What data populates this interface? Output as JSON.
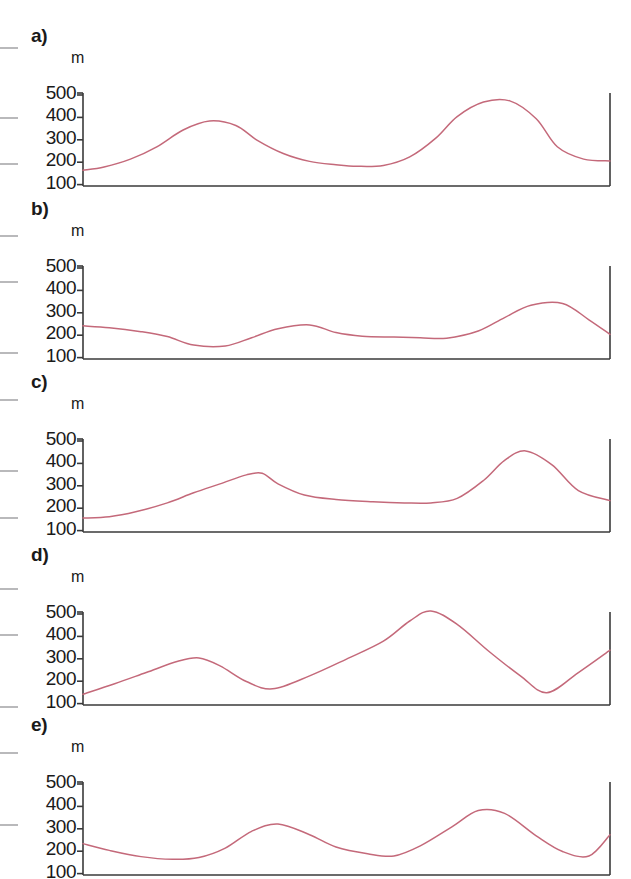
{
  "figure": {
    "curve_color": "#c4697a",
    "axis_color": "#3a3a3a",
    "text_color": "#1a1a1a",
    "edge_tick_color": "#b9b9bb",
    "unit_label": "m",
    "ytick_labels": [
      "500",
      "400",
      "300",
      "200",
      "100"
    ],
    "panel_labels": [
      "a)",
      "b)",
      "c)",
      "d)",
      "e)"
    ]
  },
  "chart_data": [
    {
      "type": "line",
      "title": "a)",
      "xlabel": "",
      "ylabel": "m",
      "ylim": [
        0,
        560
      ],
      "yticks": [
        100,
        200,
        300,
        400,
        500
      ],
      "grid": false,
      "legend": "none",
      "series": [
        {
          "name": "elevation",
          "x": [
            0,
            4,
            9,
            14,
            19,
            24,
            29,
            33,
            38,
            43,
            48,
            52,
            57,
            62,
            67,
            71,
            76,
            81,
            86,
            90,
            95,
            100
          ],
          "values": [
            70,
            85,
            120,
            175,
            250,
            290,
            270,
            205,
            145,
            110,
            95,
            88,
            92,
            130,
            215,
            310,
            375,
            380,
            300,
            175,
            120,
            112
          ]
        }
      ],
      "note": "three ridges; peaks approx 290 m, 380 m, 285 m with valleys near 90 m and 112 m; ends at 140 m"
    },
    {
      "type": "line",
      "title": "b)",
      "xlabel": "",
      "ylabel": "m",
      "ylim": [
        0,
        560
      ],
      "yticks": [
        100,
        200,
        300,
        400,
        500
      ],
      "grid": false,
      "legend": "none",
      "series": [
        {
          "name": "elevation",
          "x": [
            0,
            5,
            11,
            16,
            21,
            27,
            32,
            37,
            43,
            48,
            53,
            59,
            64,
            69,
            75,
            80,
            85,
            91,
            96,
            100
          ],
          "values": [
            148,
            140,
            122,
            100,
            62,
            58,
            95,
            135,
            152,
            118,
            102,
            98,
            95,
            93,
            125,
            185,
            240,
            248,
            175,
            110
          ]
        }
      ],
      "note": "low relief profile; minimum about 55 m, highest peak about 248 m, rises to 220 m at right edge"
    },
    {
      "type": "line",
      "title": "c)",
      "xlabel": "",
      "ylabel": "m",
      "ylim": [
        0,
        560
      ],
      "yticks": [
        100,
        200,
        300,
        400,
        500
      ],
      "grid": false,
      "legend": "none",
      "series": [
        {
          "name": "elevation",
          "x": [
            0,
            5,
            10,
            16,
            21,
            26,
            31,
            34,
            37,
            42,
            48,
            55,
            61,
            66,
            71,
            76,
            80,
            84,
            89,
            94,
            100
          ],
          "values": [
            62,
            68,
            90,
            130,
            175,
            215,
            255,
            262,
            215,
            165,
            145,
            135,
            130,
            130,
            150,
            230,
            320,
            362,
            300,
            185,
            140
          ]
        }
      ],
      "note": "asymmetric ridge peaking near 262 m with steep drop, long flat bench near 130 m, second peak about 362 m; ends at 170 m"
    },
    {
      "type": "line",
      "title": "d)",
      "xlabel": "",
      "ylabel": "m",
      "ylim": [
        0,
        560
      ],
      "yticks": [
        100,
        200,
        300,
        400,
        500
      ],
      "grid": false,
      "legend": "none",
      "series": [
        {
          "name": "elevation",
          "x": [
            0,
            6,
            12,
            18,
            22,
            26,
            31,
            36,
            43,
            50,
            57,
            62,
            66,
            71,
            77,
            83,
            88,
            94,
            100
          ],
          "values": [
            48,
            95,
            145,
            195,
            210,
            175,
            105,
            72,
            130,
            205,
            285,
            375,
            420,
            360,
            240,
            130,
            55,
            145,
            245
          ]
        }
      ],
      "note": "sharp triangular central peak about 420 m, secondary peak about 210 m, deep valleys near 70 m and 52 m"
    },
    {
      "type": "line",
      "title": "e)",
      "xlabel": "",
      "ylabel": "m",
      "ylim": [
        0,
        560
      ],
      "yticks": [
        100,
        200,
        300,
        400,
        500
      ],
      "grid": false,
      "legend": "none",
      "series": [
        {
          "name": "elevation",
          "x": [
            0,
            5,
            11,
            17,
            22,
            27,
            32,
            37,
            43,
            48,
            54,
            59,
            64,
            70,
            75,
            80,
            86,
            91,
            96,
            100
          ],
          "values": [
            140,
            110,
            82,
            70,
            78,
            120,
            195,
            228,
            180,
            125,
            95,
            85,
            130,
            215,
            288,
            275,
            175,
            105,
            85,
            180
          ]
        }
      ],
      "note": "regular wave-like profile; three peaks about 228 m, 288 m and 282 m; troughs about 70 m, 85 m and 80 m"
    }
  ]
}
